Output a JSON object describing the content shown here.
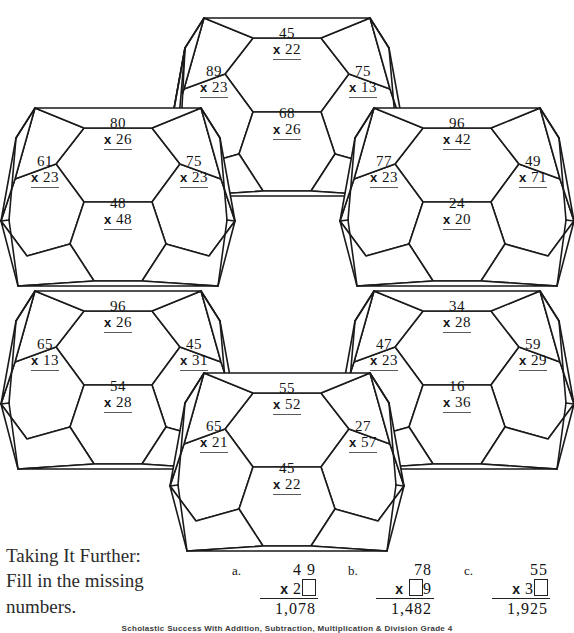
{
  "worksheet": {
    "title_note": "Taking It Further:",
    "instruction_line1": "Fill in the missing",
    "instruction_line2": "numbers.",
    "footer": "Scholastic Success With Addition, Subtraction, Multiplication & Division Grade 4",
    "ink_color": "#1a1a1a",
    "paper_color": "#ffffff"
  },
  "clusters": [
    {
      "name": "top-cluster",
      "problems": [
        {
          "cell": "top",
          "a": "45",
          "b": "22",
          "op": "x"
        },
        {
          "cell": "left",
          "a": "89",
          "b": "23",
          "op": "x"
        },
        {
          "cell": "right",
          "a": "75",
          "b": "13",
          "op": "x"
        },
        {
          "cell": "bottom",
          "a": "68",
          "b": "26",
          "op": "x"
        }
      ]
    },
    {
      "name": "upper-left-cluster",
      "problems": [
        {
          "cell": "top",
          "a": "80",
          "b": "26",
          "op": "x"
        },
        {
          "cell": "left",
          "a": "61",
          "b": "23",
          "op": "x"
        },
        {
          "cell": "right",
          "a": "75",
          "b": "23",
          "op": "x"
        },
        {
          "cell": "bottom",
          "a": "48",
          "b": "48",
          "op": "x"
        }
      ]
    },
    {
      "name": "upper-right-cluster",
      "problems": [
        {
          "cell": "top",
          "a": "96",
          "b": "42",
          "op": "x"
        },
        {
          "cell": "left",
          "a": "77",
          "b": "23",
          "op": "x"
        },
        {
          "cell": "right",
          "a": "49",
          "b": "71",
          "op": "x"
        },
        {
          "cell": "bottom",
          "a": "24",
          "b": "20",
          "op": "x"
        }
      ]
    },
    {
      "name": "lower-left-cluster",
      "problems": [
        {
          "cell": "top",
          "a": "96",
          "b": "26",
          "op": "x"
        },
        {
          "cell": "left",
          "a": "65",
          "b": "13",
          "op": "x"
        },
        {
          "cell": "right",
          "a": "45",
          "b": "31",
          "op": "x"
        },
        {
          "cell": "bottom",
          "a": "54",
          "b": "28",
          "op": "x"
        }
      ]
    },
    {
      "name": "lower-right-cluster",
      "problems": [
        {
          "cell": "top",
          "a": "34",
          "b": "28",
          "op": "x"
        },
        {
          "cell": "left",
          "a": "47",
          "b": "23",
          "op": "x"
        },
        {
          "cell": "right",
          "a": "59",
          "b": "29",
          "op": "x"
        },
        {
          "cell": "bottom",
          "a": "16",
          "b": "36",
          "op": "x"
        }
      ]
    },
    {
      "name": "bottom-cluster",
      "problems": [
        {
          "cell": "top",
          "a": "55",
          "b": "52",
          "op": "x"
        },
        {
          "cell": "left",
          "a": "65",
          "b": "21",
          "op": "x"
        },
        {
          "cell": "right",
          "a": "27",
          "b": "57",
          "op": "x"
        },
        {
          "cell": "bottom",
          "a": "45",
          "b": "22",
          "op": "x"
        }
      ]
    }
  ],
  "taking_it_further": {
    "problems": [
      {
        "label": "a.",
        "multiplicand": "4 9",
        "op": "x",
        "multiplier_prefix": "2",
        "multiplier_suffix": "",
        "blank_position": "after",
        "product": "1,078"
      },
      {
        "label": "b.",
        "multiplicand": "78",
        "op": "x",
        "multiplier_prefix": "",
        "multiplier_suffix": "9",
        "blank_position": "before",
        "product": "1,482"
      },
      {
        "label": "c.",
        "multiplicand": "55",
        "op": "x",
        "multiplier_prefix": "3",
        "multiplier_suffix": "",
        "blank_position": "after",
        "product": "1,925"
      }
    ]
  }
}
